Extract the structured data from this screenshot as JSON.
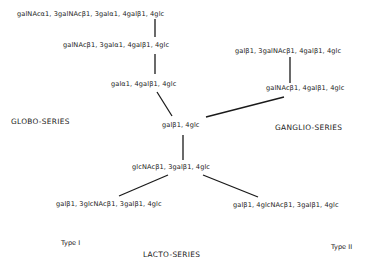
{
  "diagram": {
    "nodes": {
      "globo_top": "galNAcα1, 3galNAcβ1, 3galα1, 4galβ1, 4glc",
      "globo_mid": "galNAcβ1, 3galα1, 4galβ1, 4glc",
      "globo_base": "galα1, 4galβ1, 4glc",
      "ganglio_top": "galβ1, 3galNAcβ1, 4galβ1, 4glc",
      "ganglio_base": "galNAcβ1, 4galβ1, 4glc",
      "root": "galβ1, 4glc",
      "lacto_base": "glcNAcβ1, 3galβ1, 4glc",
      "lacto_type1": "galβ1, 3glcNAcβ1, 3galβ1, 4glc",
      "lacto_type2": "galβ1, 4glcNAcβ1, 3galβ1, 4glc"
    },
    "series_labels": {
      "globo": "GLOBO-SERIES",
      "ganglio": "GANGLIO-SERIES",
      "lacto": "LACTO-SERIES"
    },
    "type_labels": {
      "type1": "Type I",
      "type2": "Type II"
    },
    "edges": [
      [
        "globo_top",
        "globo_mid"
      ],
      [
        "globo_mid",
        "globo_base"
      ],
      [
        "globo_base",
        "root"
      ],
      [
        "ganglio_top",
        "ganglio_base"
      ],
      [
        "ganglio_base",
        "root"
      ],
      [
        "root",
        "lacto_base"
      ],
      [
        "lacto_base",
        "lacto_type1"
      ],
      [
        "lacto_base",
        "lacto_type2"
      ]
    ]
  }
}
